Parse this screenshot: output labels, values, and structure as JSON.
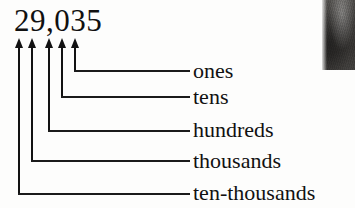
{
  "figure": {
    "kind": "place-value-diagram",
    "number": "29,035",
    "digits": [
      "2",
      "9",
      "0",
      "3",
      "5"
    ],
    "ink_color": "#121212",
    "paper_color": "#fdfdfc"
  },
  "arrows": [
    {
      "name": "arrow-digit-2",
      "digit": "2",
      "x": 18,
      "tip_y": 38,
      "bottom_y": 193
    },
    {
      "name": "arrow-digit-9",
      "digit": "9",
      "x": 31,
      "tip_y": 38,
      "bottom_y": 160
    },
    {
      "name": "arrow-digit-0",
      "digit": "0",
      "x": 48,
      "tip_y": 38,
      "bottom_y": 130
    },
    {
      "name": "arrow-digit-3",
      "digit": "3",
      "x": 61,
      "tip_y": 38,
      "bottom_y": 96
    },
    {
      "name": "arrow-digit-5",
      "digit": "5",
      "x": 74,
      "tip_y": 38,
      "bottom_y": 70
    }
  ],
  "connectors": [
    {
      "name": "connector-ones",
      "corner_x": 74,
      "y": 70,
      "end_x": 190
    },
    {
      "name": "connector-tens",
      "corner_x": 61,
      "y": 96,
      "end_x": 190
    },
    {
      "name": "connector-hundreds",
      "corner_x": 48,
      "y": 130,
      "end_x": 190
    },
    {
      "name": "connector-thousands",
      "corner_x": 31,
      "y": 160,
      "end_x": 190
    },
    {
      "name": "connector-ten-thousands",
      "corner_x": 18,
      "y": 193,
      "end_x": 190
    }
  ],
  "labels": [
    {
      "name": "label-ones",
      "text": "ones",
      "digit": "5",
      "place_value": 1,
      "top": 60
    },
    {
      "name": "label-tens",
      "text": "tens",
      "digit": "3",
      "place_value": 10,
      "top": 86
    },
    {
      "name": "label-hundreds",
      "text": "hundreds",
      "digit": "0",
      "place_value": 100,
      "top": 119
    },
    {
      "name": "label-thousands",
      "text": "thousands",
      "digit": "9",
      "place_value": 1000,
      "top": 150
    },
    {
      "name": "label-ten-thousands",
      "text": "ten-thousands",
      "digit": "2",
      "place_value": 10000,
      "top": 182
    }
  ]
}
